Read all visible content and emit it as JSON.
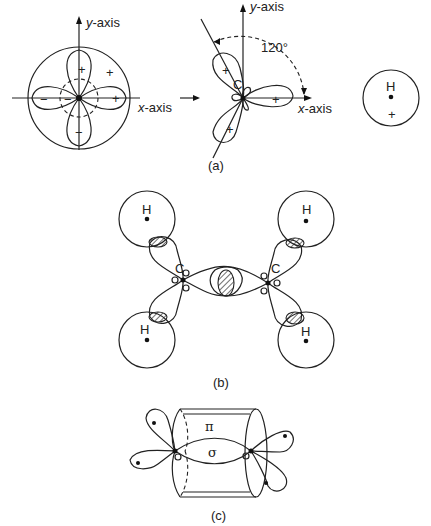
{
  "panel_a": {
    "caption": "(a)",
    "left": {
      "y_axis_label_var": "y",
      "y_axis_label_suffix": "-axis",
      "x_axis_label_var": "x",
      "x_axis_label_suffix": "-axis",
      "signs": {
        "top_lobe": "+",
        "right_lobe": "+",
        "left_lobe": "−",
        "bottom_lobe": "−",
        "inner_left": "−",
        "outer_s": "+"
      }
    },
    "arrow": "→",
    "middle": {
      "y_axis_label_var": "y",
      "y_axis_label_suffix": "-axis",
      "x_axis_label_var": "x",
      "x_axis_label_suffix": "-axis",
      "angle_label": "120°",
      "atom_label": "C",
      "signs": {
        "upper_lobe": "+",
        "right_lobe": "+",
        "lower_lobe": "+"
      }
    },
    "right": {
      "atom_label": "H",
      "sign": "+"
    }
  },
  "panel_b": {
    "caption": "(b)",
    "carbon_labels": [
      "C",
      "C"
    ],
    "hydrogen_labels": [
      "H",
      "H",
      "H",
      "H"
    ]
  },
  "panel_c": {
    "caption": "(c)",
    "pi_label": "π",
    "sigma_label": "σ"
  }
}
